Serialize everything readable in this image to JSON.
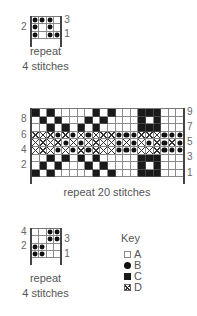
{
  "charts": [
    {
      "id": "chart-top",
      "cols": 4,
      "rows": 3,
      "cell_size": 7.3,
      "origin": {
        "x": 31,
        "y": 16
      },
      "bracket_bottom": 47,
      "grid": [
        [
          "B",
          "B",
          "B",
          "A"
        ],
        [
          "B",
          "A",
          "B",
          "A"
        ],
        [
          "B",
          "A",
          "B",
          "B"
        ]
      ],
      "row_labels_left": [
        {
          "row": 2,
          "text": "2"
        }
      ],
      "row_labels_right": [
        {
          "row": 3,
          "text": "3"
        },
        {
          "row": 1,
          "text": "1"
        }
      ],
      "caption_line1": "repeat",
      "caption_line2": "4 stitches",
      "caption_pos": {
        "x": 8,
        "y": 45,
        "w": 75
      }
    },
    {
      "id": "chart-middle",
      "cols": 20,
      "rows": 9,
      "cell_size": 7.6,
      "origin": {
        "x": 31,
        "y": 108
      },
      "bracket_bottom": 184,
      "grid": [
        [
          "C",
          "A",
          "C",
          "A",
          "A",
          "A",
          "A",
          "A",
          "C",
          "A",
          "C",
          "A",
          "A",
          "A",
          "C",
          "C",
          "C",
          "A",
          "A",
          "A"
        ],
        [
          "A",
          "C",
          "A",
          "C",
          "A",
          "A",
          "A",
          "C",
          "A",
          "C",
          "A",
          "A",
          "A",
          "A",
          "C",
          "A",
          "C",
          "A",
          "A",
          "A"
        ],
        [
          "A",
          "A",
          "C",
          "A",
          "C",
          "A",
          "C",
          "A",
          "C",
          "A",
          "A",
          "A",
          "A",
          "A",
          "C",
          "C",
          "C",
          "A",
          "A",
          "A"
        ],
        [
          "D",
          "D",
          "D",
          "B",
          "D",
          "B",
          "D",
          "B",
          "D",
          "D",
          "D",
          "B",
          "B",
          "B",
          "D",
          "D",
          "D",
          "B",
          "B",
          "B"
        ],
        [
          "D",
          "D",
          "D",
          "D",
          "B",
          "D",
          "B",
          "D",
          "D",
          "D",
          "D",
          "B",
          "D",
          "B",
          "D",
          "B",
          "D",
          "B",
          "D",
          "B"
        ],
        [
          "D",
          "D",
          "D",
          "B",
          "D",
          "B",
          "D",
          "B",
          "D",
          "D",
          "D",
          "B",
          "B",
          "B",
          "D",
          "D",
          "D",
          "B",
          "B",
          "B"
        ],
        [
          "A",
          "A",
          "C",
          "A",
          "C",
          "A",
          "C",
          "A",
          "C",
          "A",
          "A",
          "A",
          "A",
          "A",
          "C",
          "C",
          "C",
          "A",
          "A",
          "A"
        ],
        [
          "A",
          "C",
          "A",
          "C",
          "A",
          "A",
          "A",
          "C",
          "A",
          "C",
          "A",
          "A",
          "A",
          "A",
          "C",
          "A",
          "C",
          "A",
          "A",
          "A"
        ],
        [
          "C",
          "A",
          "C",
          "A",
          "A",
          "A",
          "A",
          "A",
          "C",
          "A",
          "C",
          "A",
          "A",
          "A",
          "C",
          "C",
          "C",
          "A",
          "A",
          "A"
        ]
      ],
      "row_labels_left": [
        {
          "row": 8,
          "text": "8"
        },
        {
          "row": 6,
          "text": "6"
        },
        {
          "row": 4,
          "text": "4"
        },
        {
          "row": 2,
          "text": "2"
        }
      ],
      "row_labels_right": [
        {
          "row": 9,
          "text": "9"
        },
        {
          "row": 7,
          "text": "7"
        },
        {
          "row": 5,
          "text": "5"
        },
        {
          "row": 3,
          "text": "3"
        },
        {
          "row": 1,
          "text": "1"
        }
      ],
      "caption_line1": "repeat 20 stitches",
      "caption_line2": "",
      "caption_pos": {
        "x": 30,
        "y": 186,
        "w": 154
      }
    },
    {
      "id": "chart-bottom",
      "cols": 4,
      "rows": 4,
      "cell_size": 7.3,
      "origin": {
        "x": 31,
        "y": 228
      },
      "bracket_bottom": 265,
      "grid": [
        [
          "A",
          "A",
          "B",
          "B"
        ],
        [
          "A",
          "A",
          "B",
          "B"
        ],
        [
          "B",
          "B",
          "A",
          "A"
        ],
        [
          "B",
          "B",
          "A",
          "A"
        ]
      ],
      "row_labels_left": [
        {
          "row": 4,
          "text": "4"
        },
        {
          "row": 2,
          "text": "2"
        }
      ],
      "row_labels_right": [
        {
          "row": 3,
          "text": "3"
        },
        {
          "row": 1,
          "text": "1"
        }
      ],
      "caption_line1": "repeat",
      "caption_line2": "4 stitches",
      "caption_pos": {
        "x": 8,
        "y": 272,
        "w": 75
      }
    }
  ],
  "key": {
    "title": "Key",
    "items": [
      {
        "symbol": "A",
        "label": "A",
        "description": "empty square"
      },
      {
        "symbol": "B",
        "label": "B",
        "description": "filled circle"
      },
      {
        "symbol": "C",
        "label": "C",
        "description": "filled square"
      },
      {
        "symbol": "D",
        "label": "D",
        "description": "crossed square"
      }
    ]
  }
}
